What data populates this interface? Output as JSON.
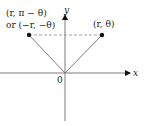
{
  "diagram": {
    "axes": {
      "x_label": "x",
      "y_label": "y",
      "origin_label": "0"
    },
    "points": [
      {
        "id": "p1",
        "label_line1": "(r, θ)",
        "label_line2": ""
      },
      {
        "id": "p2",
        "label_line1": "(r, π − θ)",
        "label_line2": "or (−r, −θ)"
      }
    ],
    "colors": {
      "axis": "#7a7a7a",
      "line": "#6e6e6e",
      "dashed": "#8a8a8a",
      "point": "#111111",
      "text": "#222222"
    }
  }
}
